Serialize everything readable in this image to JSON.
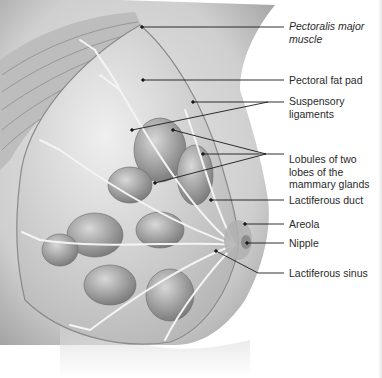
{
  "diagram": {
    "colors": {
      "background": "#ffffff",
      "skin": "#d9d9d9",
      "skin_shadow": "#a8a8a8",
      "muscle": "#bdbdbd",
      "muscle_stripe": "#8f8f8f",
      "fat": "#c9c9c9",
      "lobule": "#9a9a9a",
      "duct": "#f2f2f2",
      "leader": "#1a1a1a",
      "text": "#2a2a2a"
    },
    "labels": [
      {
        "id": "pectoralis-major",
        "text": "Pectoralis major\nmuscle",
        "italic": true,
        "top": 20
      },
      {
        "id": "pectoral-fat-pad",
        "text": "Pectoral fat pad",
        "italic": false,
        "top": 74
      },
      {
        "id": "suspensory-ligaments",
        "text": "Suspensory\nligaments",
        "italic": false,
        "top": 95
      },
      {
        "id": "lobules",
        "text": "Lobules of two\nlobes of the\nmammary glands",
        "italic": false,
        "top": 153
      },
      {
        "id": "lactiferous-duct",
        "text": "Lactiferous duct",
        "italic": false,
        "top": 194
      },
      {
        "id": "areola",
        "text": "Areola",
        "italic": false,
        "top": 218
      },
      {
        "id": "nipple",
        "text": "Nipple",
        "italic": false,
        "top": 237
      },
      {
        "id": "lactiferous-sinus",
        "text": "Lactiferous sinus",
        "italic": false,
        "top": 267
      }
    ],
    "leaders": [
      {
        "label": "pectoralis-major",
        "points": "284,27 142,27"
      },
      {
        "label": "pectoral-fat-pad",
        "points": "284,80 143,80"
      },
      {
        "label": "suspensory-ligaments",
        "points": "284,102 193,102"
      },
      {
        "label": "suspensory-ligaments",
        "points": "268,102 132,130"
      },
      {
        "label": "lobules",
        "points": "284,154 266,154 173,130"
      },
      {
        "label": "lobules",
        "points": "266,154 203,154"
      },
      {
        "label": "lobules",
        "points": "266,154 155,183"
      },
      {
        "label": "lactiferous-duct",
        "points": "284,200 211,200"
      },
      {
        "label": "areola",
        "points": "284,224 245,224"
      },
      {
        "label": "nipple",
        "points": "284,243 247,243"
      },
      {
        "label": "lactiferous-sinus",
        "points": "284,273 258,273 216,251"
      }
    ]
  }
}
